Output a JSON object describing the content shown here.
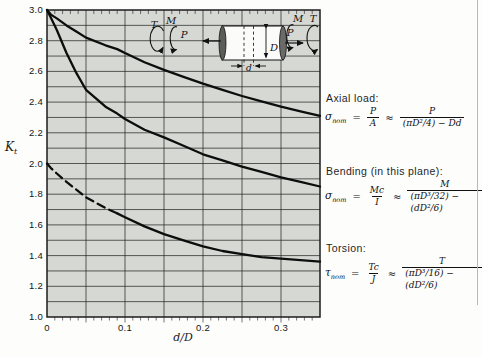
{
  "figure": {
    "plot_bg_color": "#d6d9d3",
    "grid_color": "#1c1c1c",
    "curve_color": "#0d0d0d"
  },
  "chart_data": {
    "type": "line",
    "title": "",
    "xlabel": "d/D",
    "ylabel": "Kt",
    "xlim": [
      0,
      0.35
    ],
    "ylim": [
      1.0,
      3.0
    ],
    "x_major_grid": 0.05,
    "y_major_grid": 0.1,
    "x_minor_tick": 0.01,
    "grid": true,
    "legend_position": "none",
    "xticks": [
      {
        "v": 0,
        "label": "0"
      },
      {
        "v": 0.1,
        "label": "0.1"
      },
      {
        "v": 0.2,
        "label": "0.2"
      },
      {
        "v": 0.3,
        "label": "0.3"
      }
    ],
    "yticks": [
      {
        "v": 3.0,
        "label": "3.0"
      },
      {
        "v": 2.8,
        "label": "2.8"
      },
      {
        "v": 2.6,
        "label": "2.6"
      },
      {
        "v": 2.4,
        "label": "2.4"
      },
      {
        "v": 2.2,
        "label": "2.2"
      },
      {
        "v": 2.0,
        "label": "2.0"
      },
      {
        "v": 1.8,
        "label": "1.8"
      },
      {
        "v": 1.6,
        "label": "1.6"
      },
      {
        "v": 1.4,
        "label": "1.4"
      },
      {
        "v": 1.2,
        "label": "1.2"
      },
      {
        "v": 1.0,
        "label": "1.0"
      }
    ],
    "x": [
      0,
      0.005,
      0.0125,
      0.025,
      0.0375,
      0.05,
      0.075,
      0.09,
      0.1,
      0.125,
      0.15,
      0.175,
      0.2,
      0.225,
      0.25,
      0.275,
      0.3,
      0.325,
      0.35
    ],
    "series": [
      {
        "name": "axial",
        "style": "solid",
        "values": [
          3.0,
          2.97,
          2.945,
          2.9,
          2.86,
          2.82,
          2.77,
          2.745,
          2.72,
          2.66,
          2.61,
          2.565,
          2.52,
          2.48,
          2.44,
          2.405,
          2.37,
          2.34,
          2.31
        ]
      },
      {
        "name": "bending",
        "style": "solid",
        "values": [
          3.0,
          2.95,
          2.87,
          2.72,
          2.59,
          2.48,
          2.37,
          2.325,
          2.29,
          2.22,
          2.17,
          2.115,
          2.06,
          2.02,
          1.98,
          1.945,
          1.91,
          1.88,
          1.85
        ]
      },
      {
        "name": "torsion",
        "style": "dashed_then_solid",
        "dash_until": 0.09,
        "values": [
          2.0,
          1.97,
          1.935,
          1.88,
          1.83,
          1.78,
          1.71,
          1.675,
          1.65,
          1.59,
          1.54,
          1.5,
          1.46,
          1.43,
          1.41,
          1.39,
          1.38,
          1.37,
          1.36
        ]
      }
    ]
  },
  "axis": {
    "y_symbol": "K",
    "y_symbol_sub": "t",
    "x_title": "d/D"
  },
  "inset": {
    "t_left": "T",
    "m_left": "M",
    "p_left": "P",
    "d_big": "D",
    "d_small": "d",
    "p_right": "P",
    "m_right": "M",
    "t_right": "T"
  },
  "annotations": {
    "axial": {
      "title": "Axial load:",
      "lhs": "σ",
      "lhs_sub": "nom",
      "eq": "=",
      "f1num": "P",
      "f1den": "A",
      "approx": "≈",
      "f2num": "P",
      "f2den": "(πD²/4) − Dd"
    },
    "bending": {
      "title": "Bending (in this plane):",
      "lhs": "σ",
      "lhs_sub": "nom",
      "eq": "=",
      "f1num": "Mc",
      "f1den": "I",
      "approx": "≈",
      "f2num": "M",
      "f2den": "(πD³/32) − (dD²/6)"
    },
    "torsion": {
      "title": "Torsion:",
      "lhs": "τ",
      "lhs_sub": "nom",
      "eq": "=",
      "f1num": "Tc",
      "f1den": "J",
      "approx": "≈",
      "f2num": "T",
      "f2den": "(πD³/16) − (dD²/6)"
    }
  }
}
